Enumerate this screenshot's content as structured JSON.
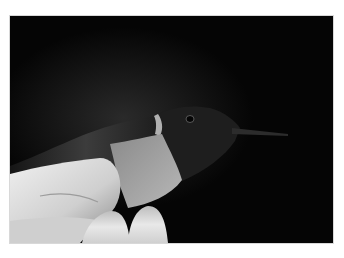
{
  "photo": {
    "subject": "hummingbird held between fingers",
    "style": "black-and-white photograph",
    "colors": {
      "background": "#050505",
      "border": "#ffffff",
      "skin_highlight": "#e6e6e6",
      "skin_shadow": "#8a8a8a",
      "feathers": "#3a3a3a",
      "throat": "#9a9a9a"
    }
  }
}
